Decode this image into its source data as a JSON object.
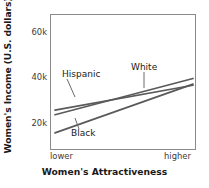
{
  "chart_data": {
    "type": "line",
    "title": "",
    "xlabel": "Women's Attractiveness",
    "ylabel": "Women's Income (U.S. dollars)",
    "x": [
      0,
      1
    ],
    "xtick_labels": [
      "lower",
      "higher"
    ],
    "ytick_labels": [
      "20k",
      "40k",
      "60k"
    ],
    "ytick_values": [
      20000,
      40000,
      60000
    ],
    "ylim": [
      8000,
      68000
    ],
    "xlim": [
      0,
      1
    ],
    "grid": false,
    "legend": "inline-annotations",
    "series": [
      {
        "name": "Hispanic",
        "label": "Hispanic",
        "values": [
          26000,
          37000
        ],
        "color": "#5a5a5a"
      },
      {
        "name": "White",
        "label": "White",
        "values": [
          24000,
          40000
        ],
        "color": "#5a5a5a"
      },
      {
        "name": "Black",
        "label": "Black",
        "values": [
          16000,
          37500
        ],
        "color": "#5a5a5a"
      }
    ],
    "annotations": [
      {
        "text": "Hispanic",
        "target_series": "Hispanic"
      },
      {
        "text": "White",
        "target_series": "White"
      },
      {
        "text": "Black",
        "target_series": "Black"
      }
    ],
    "axis_color": "#8a8a8a",
    "line_color": "#5a5a5a",
    "background": "#ffffff"
  }
}
